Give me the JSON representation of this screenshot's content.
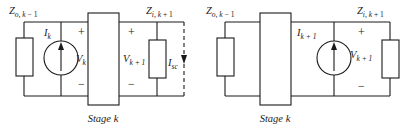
{
  "figure": {
    "name": "two-stage-equivalent-circuit-diagram",
    "background_color": "#ffffff",
    "line_color": "#1a1a1a"
  },
  "left_circuit": {
    "name": "short-circuit-current-equivalent",
    "impedance_left": {
      "symbol": "Z",
      "sub_main": "o, k",
      "sub_tail": " − 1",
      "full": "Zo, k−1"
    },
    "impedance_right": {
      "symbol": "Z",
      "sub_main": "i, k",
      "sub_tail": " + 1",
      "full": "Zi, k+1"
    },
    "current_source": {
      "symbol": "I",
      "sub": "k",
      "full": "Ik",
      "direction": "up"
    },
    "voltage_in": {
      "symbol": "V",
      "sub": "k",
      "full": "Vk",
      "plus": "+",
      "minus": "−"
    },
    "voltage_out": {
      "symbol": "V",
      "sub": "k + 1",
      "full": "Vk+1",
      "plus": "+",
      "minus": "−"
    },
    "short_circuit_current": {
      "symbol": "I",
      "sub": "sc",
      "full": "Isc",
      "direction": "down",
      "line_style": "dashed"
    },
    "stage_label": "Stage k"
  },
  "right_circuit": {
    "name": "open-circuit-voltage-equivalent",
    "impedance_left": {
      "symbol": "Z",
      "sub_main": "o, k",
      "sub_tail": " − 1",
      "full": "Zo, k−1"
    },
    "impedance_right": {
      "symbol": "Z",
      "sub_main": "i, k",
      "sub_tail": " + 1",
      "full": "Zi, k+1"
    },
    "current_source": {
      "symbol": "I",
      "sub": "k + 1",
      "full": "Ik+1",
      "direction": "up"
    },
    "voltage_out": {
      "symbol": "V",
      "sub": "k + 1",
      "full": "Vk+1",
      "plus": "+",
      "minus": "−"
    },
    "stage_label": "Stage k"
  }
}
